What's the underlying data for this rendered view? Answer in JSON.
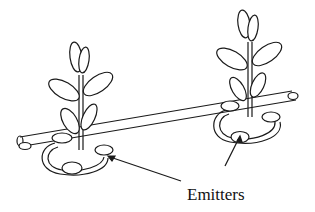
{
  "diagram": {
    "label": "Emitters",
    "stroke_color": "#1a1a1a",
    "background": "#ffffff",
    "elements": [
      "lateral-pipe",
      "plant-left",
      "plant-right",
      "emitter-ring-left",
      "emitter-ring-right",
      "emitters",
      "pointer-arrows"
    ]
  }
}
